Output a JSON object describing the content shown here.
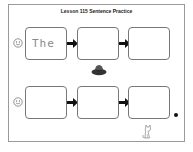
{
  "worksheet": {
    "title": "Lesson 115 Sentence Practice",
    "rows": [
      {
        "icon": "smiley-face-icon",
        "boxes": [
          {
            "text": "The"
          },
          {
            "text": ""
          },
          {
            "text": ""
          }
        ]
      },
      {
        "icon": "smiley-face-icon",
        "boxes": [
          {
            "text": ""
          },
          {
            "text": ""
          },
          {
            "text": ""
          }
        ],
        "end_punctuation": "period"
      }
    ],
    "decorations": [
      "hat-icon",
      "cat-icon"
    ]
  }
}
